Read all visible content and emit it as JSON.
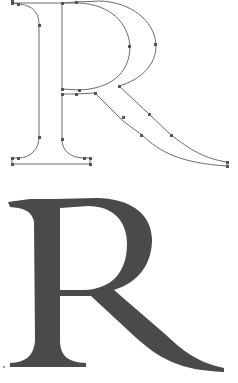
{
  "figure": {
    "letter": "R",
    "panels": [
      {
        "id": "outline",
        "description": "Bézier outline with anchor points"
      },
      {
        "id": "filled",
        "description": "Filled glyph rendering"
      }
    ],
    "colors": {
      "background": "#ffffff",
      "outline_stroke": "#6a6a6a",
      "anchor_point": "#555555",
      "glyph_fill": "#4a4a4a"
    }
  }
}
